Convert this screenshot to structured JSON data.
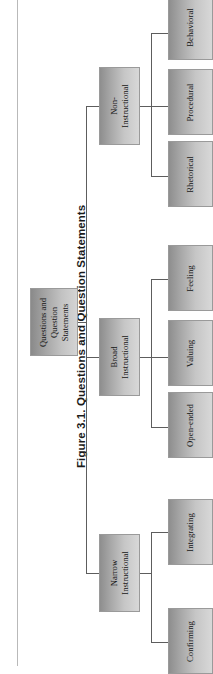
{
  "figure": {
    "caption": "Figure 3.1. Questions and Question Statements",
    "orientation": "rotated-90-ccw",
    "type": "organizational-tree"
  },
  "chart_data": {
    "type": "diagram",
    "title": "Figure 3.1. Questions and Question Statements",
    "root": "Questions and Question Statements",
    "levels": 3,
    "nodes": [
      {
        "id": "root",
        "label": "Questions and Question Statements",
        "level": 1,
        "parent": null
      },
      {
        "id": "non_instructional",
        "label": "Non-Instructional",
        "level": 2,
        "parent": "root"
      },
      {
        "id": "broad_instructional",
        "label": "Broad Instructional",
        "level": 2,
        "parent": "root"
      },
      {
        "id": "narrow_instructional",
        "label": "Narrow Instructional",
        "level": 2,
        "parent": "root"
      },
      {
        "id": "behavioral",
        "label": "Behavioral",
        "level": 3,
        "parent": "non_instructional"
      },
      {
        "id": "procedural",
        "label": "Procedural",
        "level": 3,
        "parent": "non_instructional"
      },
      {
        "id": "rhetorical",
        "label": "Rhetorical",
        "level": 3,
        "parent": "non_instructional"
      },
      {
        "id": "feeling",
        "label": "Feeling",
        "level": 3,
        "parent": "broad_instructional"
      },
      {
        "id": "valuing",
        "label": "Valuing",
        "level": 3,
        "parent": "broad_instructional"
      },
      {
        "id": "open_ended",
        "label": "Open-ended",
        "level": 3,
        "parent": "broad_instructional"
      },
      {
        "id": "integrating",
        "label": "Integrating",
        "level": 3,
        "parent": "narrow_instructional"
      },
      {
        "id": "confirming",
        "label": "Confirming",
        "level": 3,
        "parent": "narrow_instructional"
      }
    ],
    "colors": {
      "box_dark": "#8e8e8e",
      "box_light": "#d8d8d8",
      "box_border": "#9a9a9a",
      "connector": "#5d5d5d",
      "page_rule": "#b9b9b9",
      "text": "#161616",
      "caption_text": "#1b1b1b",
      "background": "#ffffff"
    }
  },
  "tree": {
    "root": {
      "label": "Questions and Question Statements"
    },
    "branches": [
      {
        "label": "Non-Instructional",
        "children": [
          {
            "label": "Behavioral"
          },
          {
            "label": "Procedural"
          },
          {
            "label": "Rhetorical"
          }
        ]
      },
      {
        "label": "Broad Instructional",
        "children": [
          {
            "label": "Feeling"
          },
          {
            "label": "Valuing"
          },
          {
            "label": "Open-ended"
          }
        ]
      },
      {
        "label": "Narrow Instructional",
        "children": [
          {
            "label": "Integrating"
          },
          {
            "label": "Confirming"
          }
        ]
      }
    ]
  }
}
